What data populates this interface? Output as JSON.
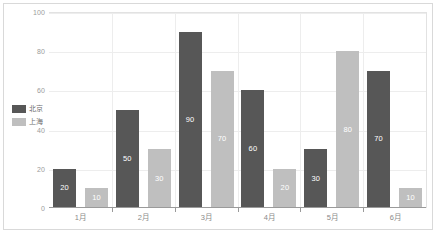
{
  "chart_data": {
    "type": "bar",
    "title": "",
    "subtitle": "",
    "xlabel": "",
    "ylabel": "",
    "categories": [
      "1月",
      "2月",
      "3月",
      "4月",
      "5月",
      "6月"
    ],
    "series": [
      {
        "name": "北京",
        "color": "#575757",
        "values": [
          20,
          50,
          90,
          60,
          30,
          70
        ]
      },
      {
        "name": "上海",
        "color": "#bfbfbf",
        "values": [
          10,
          30,
          70,
          20,
          80,
          10
        ]
      }
    ],
    "ylim": [
      0,
      100
    ],
    "y_ticks": [
      0,
      20,
      40,
      60,
      80,
      100
    ],
    "y_tick_labels": [
      "0",
      "20",
      "40",
      "60",
      "80",
      "100"
    ],
    "grid": true,
    "grid_axis": "y",
    "legend_position": "left",
    "data_labels": true,
    "data_label_color": "#ffffff",
    "background_color": "#ffffff",
    "border_color": "#d9d9d9",
    "gridline_color": "#ededed",
    "axis_color": "#9a9a9a",
    "tick_label_color": "#9b9b9b"
  }
}
